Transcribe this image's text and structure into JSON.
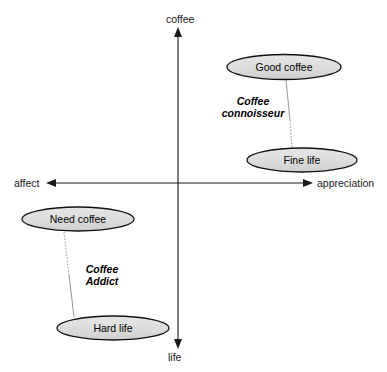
{
  "diagram": {
    "type": "perceptual-map",
    "title": "",
    "background_color": "#ffffff",
    "node_fill_color": "#dcdcdc",
    "node_stroke_color": "#000000",
    "axis_color": "#1a1a1a",
    "connector_color": "#999999",
    "axes": {
      "vertical": {
        "top_label": "coffee",
        "bottom_label": "life",
        "x": 178,
        "top_y": 28,
        "bottom_y": 348
      },
      "horizontal": {
        "left_label": "affect",
        "right_label": "appreciation",
        "y": 183,
        "left_x": 47,
        "right_x": 312
      }
    },
    "nodes": [
      {
        "id": "good-coffee",
        "label": "Good coffee",
        "cx": 284,
        "cy": 67,
        "rx": 57,
        "ry": 12,
        "quadrant": "upper-right"
      },
      {
        "id": "fine-life",
        "label": "Fine life",
        "cx": 302,
        "cy": 160,
        "rx": 55,
        "ry": 12,
        "quadrant": "upper-right"
      },
      {
        "id": "need-coffee",
        "label": "Need coffee",
        "cx": 78,
        "cy": 219,
        "rx": 56,
        "ry": 12,
        "quadrant": "lower-left"
      },
      {
        "id": "hard-life",
        "label": "Hard life",
        "cx": 113,
        "cy": 328,
        "rx": 56,
        "ry": 12,
        "quadrant": "lower-left"
      }
    ],
    "connectors": [
      {
        "id": "connoisseur-link",
        "from": "good-coffee",
        "to": "fine-life",
        "x1": 286,
        "y1": 80,
        "x2": 292,
        "y2": 149
      },
      {
        "id": "addict-link",
        "from": "need-coffee",
        "to": "hard-life",
        "x1": 64,
        "y1": 232,
        "x2": 74,
        "y2": 317
      }
    ],
    "groups": [
      {
        "id": "coffee-connoisseur",
        "line1": "Coffee",
        "line2": "connoisseur",
        "x": 222,
        "y": 95
      },
      {
        "id": "coffee-addict",
        "line1": "Coffee",
        "line2": "Addict",
        "x": 84,
        "y": 263
      }
    ]
  }
}
